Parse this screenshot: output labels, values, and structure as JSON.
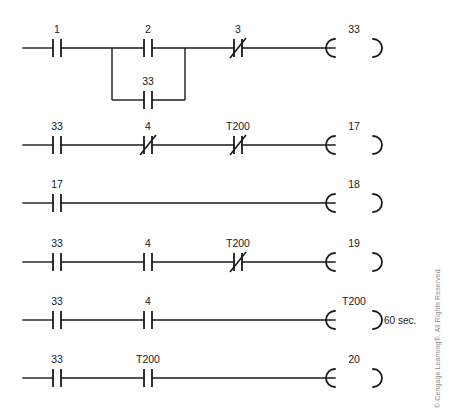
{
  "diagram": {
    "type": "ladder-logic",
    "colors": {
      "line": "#1a1a1a",
      "background": "#ffffff",
      "copyright": "#8c8c8c"
    },
    "copyright": "© Cengage Learning®. All Rights Reserved.",
    "rungs": [
      {
        "index": 1,
        "y": 48,
        "contacts": [
          {
            "label": "1",
            "type": "normally-open",
            "x": 57
          },
          {
            "label": "2",
            "type": "normally-open",
            "x": 148
          },
          {
            "label": "3",
            "type": "normally-closed",
            "x": 238
          }
        ],
        "branch": {
          "label": "33",
          "type": "normally-open",
          "x": 148,
          "y": 100,
          "left_x": 112,
          "right_x": 185
        },
        "coil": {
          "label": "33",
          "type": "output-coil",
          "x": 348
        }
      },
      {
        "index": 2,
        "y": 145,
        "contacts": [
          {
            "label": "33",
            "type": "normally-open",
            "x": 57
          },
          {
            "label": "4",
            "type": "normally-closed",
            "x": 148
          },
          {
            "label": "T200",
            "type": "normally-closed",
            "x": 238
          }
        ],
        "branch": null,
        "coil": {
          "label": "17",
          "type": "output-coil",
          "x": 348
        }
      },
      {
        "index": 3,
        "y": 203,
        "contacts": [
          {
            "label": "17",
            "type": "normally-open",
            "x": 57
          }
        ],
        "branch": null,
        "coil": {
          "label": "18",
          "type": "output-coil",
          "x": 348
        }
      },
      {
        "index": 4,
        "y": 262,
        "contacts": [
          {
            "label": "33",
            "type": "normally-open",
            "x": 57
          },
          {
            "label": "4",
            "type": "normally-open",
            "x": 148
          },
          {
            "label": "T200",
            "type": "normally-closed",
            "x": 238
          }
        ],
        "branch": null,
        "coil": {
          "label": "19",
          "type": "output-coil",
          "x": 348
        }
      },
      {
        "index": 5,
        "y": 320,
        "contacts": [
          {
            "label": "33",
            "type": "normally-open",
            "x": 57
          },
          {
            "label": "4",
            "type": "normally-open",
            "x": 148
          }
        ],
        "branch": null,
        "coil": {
          "label": "T200",
          "type": "timer-coil",
          "x": 348,
          "note": "60 sec."
        }
      },
      {
        "index": 6,
        "y": 378,
        "contacts": [
          {
            "label": "33",
            "type": "normally-open",
            "x": 57
          },
          {
            "label": "T200",
            "type": "normally-open",
            "x": 148
          }
        ],
        "branch": null,
        "coil": {
          "label": "20",
          "type": "output-coil",
          "x": 348
        }
      }
    ],
    "geometry": {
      "rail_start_x": 23,
      "coil_left_x": 330,
      "coil_right_x": 378,
      "contact_gap": 8,
      "contact_half_height": 9,
      "label_offset_y": 16
    }
  }
}
